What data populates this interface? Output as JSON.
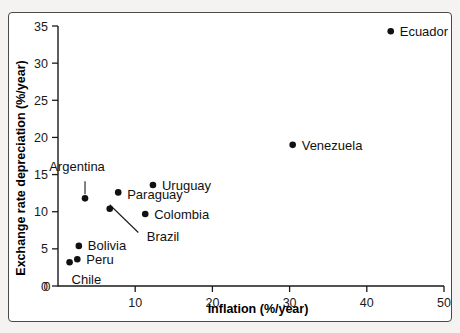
{
  "chart_data": {
    "type": "scatter",
    "title": "",
    "xlabel": "Inflation (%/year)",
    "ylabel": "Exchange rate depreciation (%/year)",
    "xlim": [
      0,
      50
    ],
    "ylim": [
      0,
      35
    ],
    "xticks": [
      "0",
      "10",
      "20",
      "30",
      "40",
      "50"
    ],
    "xtick_values": [
      0,
      10,
      20,
      30,
      40,
      50
    ],
    "yticks": [
      "0",
      "5",
      "10",
      "15",
      "20",
      "25",
      "30",
      "35"
    ],
    "ytick_values": [
      0,
      5,
      10,
      15,
      20,
      25,
      30,
      35
    ],
    "grid": false,
    "legend": "none",
    "marker_color": "#111111",
    "axis_color": "#1a1a1a",
    "points": [
      {
        "label": "Chile",
        "x": 1.5,
        "y": 3.2,
        "label_dx": 2,
        "label_dy": 22,
        "anchor": "start",
        "leader": false
      },
      {
        "label": "Peru",
        "x": 2.5,
        "y": 3.6,
        "label_dx": 9,
        "label_dy": 5,
        "anchor": "start",
        "leader": false
      },
      {
        "label": "Bolivia",
        "x": 2.7,
        "y": 5.4,
        "label_dx": 9,
        "label_dy": 4,
        "anchor": "start",
        "leader": false
      },
      {
        "label": "Argentina",
        "x": 3.5,
        "y": 11.8,
        "label_dx": -8,
        "label_dy": -27,
        "anchor": "middle",
        "leader": true,
        "leader_x2": 3.5,
        "leader_y2": 14.1
      },
      {
        "label": "Brazil",
        "x": 6.7,
        "y": 10.4,
        "label_dx": 37,
        "label_dy": 32,
        "anchor": "start",
        "leader": true,
        "leader_x2": 10.4,
        "leader_y2": 7.2
      },
      {
        "label": "Paraguay",
        "x": 7.8,
        "y": 12.6,
        "label_dx": 9,
        "label_dy": 7,
        "anchor": "start",
        "leader": false
      },
      {
        "label": "Colombia",
        "x": 11.3,
        "y": 9.7,
        "label_dx": 9,
        "label_dy": 5,
        "anchor": "start",
        "leader": false
      },
      {
        "label": "Uruguay",
        "x": 12.3,
        "y": 13.6,
        "label_dx": 9,
        "label_dy": 5,
        "anchor": "start",
        "leader": false
      },
      {
        "label": "Venezuela",
        "x": 30.4,
        "y": 19.0,
        "label_dx": 9,
        "label_dy": 5,
        "anchor": "start",
        "leader": false
      },
      {
        "label": "Ecuador",
        "x": 43.1,
        "y": 34.3,
        "label_dx": 9,
        "label_dy": 5,
        "anchor": "start",
        "leader": false
      }
    ]
  }
}
